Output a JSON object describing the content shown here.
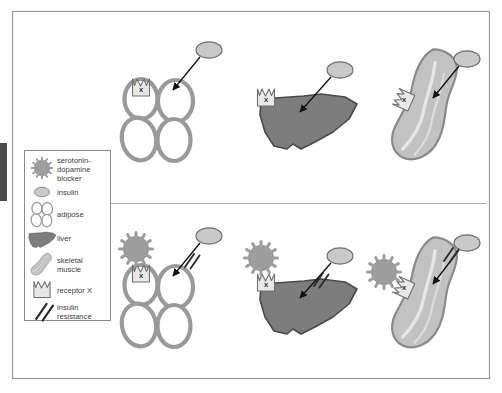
{
  "figure": {
    "title": "",
    "type": "biomedical-mechanism-diagram",
    "frame": {
      "border_color": "#999999",
      "background": "#ffffff"
    },
    "row_divider": {
      "present": true,
      "color": "#aaaaaa"
    },
    "edge_tab": {
      "name": "page-edge-marker",
      "color": "#4a4a4a"
    }
  },
  "colors": {
    "insulin_fill": "#c9c9c9",
    "insulin_stroke": "#6e6e6e",
    "adipose_stroke": "#9a9a9a",
    "adipose_fill": "#ffffff",
    "liver_fill": "#7d7d7d",
    "liver_stroke": "#4a4a4a",
    "muscle_fill": "#c2c2c2",
    "muscle_stroke": "#8a8a8a",
    "blocker_fill": "#9e9e9e",
    "blocker_stroke": "#8a8a8a",
    "receptor_fill": "#e8e8e8",
    "receptor_stroke": "#707070",
    "arrow_color": "#111111",
    "resistance_color": "#2b2b2b"
  },
  "legend": {
    "name": "legend-box",
    "items": [
      {
        "icon": "serotonin-dopamine-blocker-icon",
        "label": "serotonin-\ndopamine\nblocker",
        "lines": [
          "serotonin-",
          "dopamine",
          "blocker"
        ]
      },
      {
        "icon": "insulin-icon",
        "label": "insulin",
        "lines": [
          "insulin"
        ]
      },
      {
        "icon": "adipose-icon",
        "label": "adipose",
        "lines": [
          "adipose"
        ]
      },
      {
        "icon": "liver-icon",
        "label": "liver",
        "lines": [
          "liver"
        ]
      },
      {
        "icon": "skeletal-muscle-icon",
        "label": "skeletal muscle",
        "lines": [
          "skeletal",
          "muscle"
        ]
      },
      {
        "icon": "receptor-x-icon",
        "label": "receptor X",
        "lines": [
          "receptor X"
        ]
      },
      {
        "icon": "insulin-resistance-icon",
        "label": "insulin resistance",
        "lines": [
          "insulin",
          "resistance"
        ]
      }
    ]
  },
  "rows": [
    {
      "name": "row-normal",
      "blocker_present": false,
      "resistance_present": true,
      "panels": [
        {
          "name": "panel-adipose-normal",
          "tissue": "adipose",
          "receptor_label": "X",
          "has_insulin": true,
          "has_arrow": true,
          "has_blocker": false,
          "has_resistance": false
        },
        {
          "name": "panel-liver-normal",
          "tissue": "liver",
          "receptor_label": "X",
          "has_insulin": true,
          "has_arrow": true,
          "has_blocker": false,
          "has_resistance": false
        },
        {
          "name": "panel-muscle-normal",
          "tissue": "skeletal muscle",
          "receptor_label": "X",
          "has_insulin": true,
          "has_arrow": true,
          "has_blocker": false,
          "has_resistance": false
        }
      ]
    },
    {
      "name": "row-blocked",
      "blocker_present": true,
      "resistance_present": true,
      "panels": [
        {
          "name": "panel-adipose-blocked",
          "tissue": "adipose",
          "receptor_label": "X",
          "has_insulin": true,
          "has_arrow": true,
          "has_blocker": true,
          "has_resistance": true
        },
        {
          "name": "panel-liver-blocked",
          "tissue": "liver",
          "receptor_label": "X",
          "has_insulin": true,
          "has_arrow": true,
          "has_blocker": true,
          "has_resistance": true
        },
        {
          "name": "panel-muscle-blocked",
          "tissue": "skeletal muscle",
          "receptor_label": "X",
          "has_insulin": true,
          "has_arrow": true,
          "has_blocker": true,
          "has_resistance": true
        }
      ]
    }
  ],
  "receptor_labels": {
    "adipose_top": "X",
    "liver_top": "X",
    "muscle_top": "X",
    "adipose_bottom": "X",
    "liver_bottom": "X",
    "muscle_bottom": "X"
  }
}
